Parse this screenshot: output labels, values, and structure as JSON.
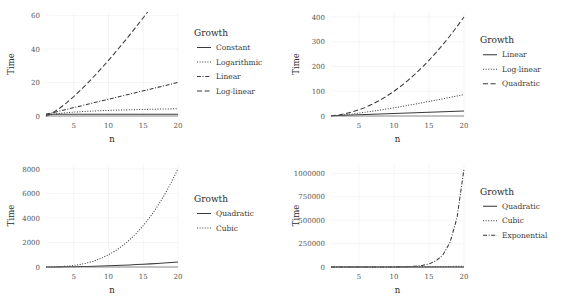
{
  "figure": {
    "background": "#ffffff",
    "line_color": "#3a3a3a",
    "grid_color": "#f2f2f2",
    "axis_color": "#6e6e6e",
    "panel_count": 4
  },
  "chart_data": [
    {
      "type": "line",
      "panel": "top-left",
      "title": "",
      "xlabel": "n",
      "ylabel": "Time",
      "legend_title": "Growth",
      "legend_position": "right",
      "grid": true,
      "xlim": [
        1,
        20
      ],
      "ylim": [
        0,
        62
      ],
      "xticks": [
        5,
        10,
        15,
        20
      ],
      "xtick_labels": [
        "5",
        "10",
        "15",
        "20"
      ],
      "yticks": [
        0,
        20,
        40,
        60
      ],
      "ytick_labels": [
        "0",
        "20",
        "40",
        "60"
      ],
      "x": [
        1,
        2,
        3,
        4,
        5,
        6,
        7,
        8,
        9,
        10,
        11,
        12,
        13,
        14,
        15,
        16,
        17,
        18,
        19,
        20
      ],
      "series": [
        {
          "name": "Constant",
          "dash": "solid",
          "values": [
            1,
            1,
            1,
            1,
            1,
            1,
            1,
            1,
            1,
            1,
            1,
            1,
            1,
            1,
            1,
            1,
            1,
            1,
            1,
            1
          ]
        },
        {
          "name": "Logarithmic",
          "dash": "dotted",
          "values": [
            0,
            1,
            1.58,
            2,
            2.32,
            2.58,
            2.81,
            3,
            3.17,
            3.32,
            3.46,
            3.58,
            3.7,
            3.81,
            3.91,
            4,
            4.09,
            4.17,
            4.25,
            4.32
          ]
        },
        {
          "name": "Linear",
          "dash": "dashdot",
          "values": [
            1,
            2,
            3,
            4,
            5,
            6,
            7,
            8,
            9,
            10,
            11,
            12,
            13,
            14,
            15,
            16,
            17,
            18,
            19,
            20
          ]
        },
        {
          "name": "Log-linear",
          "dash": "dashed",
          "values": [
            0,
            2,
            4.75,
            8,
            11.61,
            15.51,
            19.65,
            24,
            28.53,
            33.22,
            38.05,
            43,
            48.07,
            53.3,
            58.6,
            64,
            69.5,
            75.1,
            80.7,
            86.4
          ]
        }
      ]
    },
    {
      "type": "line",
      "panel": "top-right",
      "title": "",
      "xlabel": "n",
      "ylabel": "Time",
      "legend_title": "Growth",
      "legend_position": "right",
      "grid": true,
      "xlim": [
        1,
        20
      ],
      "ylim": [
        0,
        420
      ],
      "xticks": [
        5,
        10,
        15,
        20
      ],
      "xtick_labels": [
        "5",
        "10",
        "15",
        "20"
      ],
      "yticks": [
        0,
        100,
        200,
        300,
        400
      ],
      "ytick_labels": [
        "0",
        "100",
        "200",
        "300",
        "400"
      ],
      "x": [
        1,
        2,
        3,
        4,
        5,
        6,
        7,
        8,
        9,
        10,
        11,
        12,
        13,
        14,
        15,
        16,
        17,
        18,
        19,
        20
      ],
      "series": [
        {
          "name": "Linear",
          "dash": "solid",
          "values": [
            1,
            2,
            3,
            4,
            5,
            6,
            7,
            8,
            9,
            10,
            11,
            12,
            13,
            14,
            15,
            16,
            17,
            18,
            19,
            20
          ]
        },
        {
          "name": "Log-linear",
          "dash": "dotted",
          "values": [
            0,
            2,
            4.75,
            8,
            11.61,
            15.51,
            19.65,
            24,
            28.53,
            33.22,
            38.05,
            43,
            48.07,
            53.3,
            58.6,
            64,
            69.5,
            75.1,
            80.7,
            86.4
          ]
        },
        {
          "name": "Quadratic",
          "dash": "dashed",
          "values": [
            1,
            4,
            9,
            16,
            25,
            36,
            49,
            64,
            81,
            100,
            121,
            144,
            169,
            196,
            225,
            256,
            289,
            324,
            361,
            400
          ]
        }
      ]
    },
    {
      "type": "line",
      "panel": "bottom-left",
      "title": "",
      "xlabel": "n",
      "ylabel": "Time",
      "legend_title": "Growth",
      "legend_position": "right",
      "grid": true,
      "xlim": [
        1,
        20
      ],
      "ylim": [
        0,
        8400
      ],
      "xticks": [
        5,
        10,
        15,
        20
      ],
      "xtick_labels": [
        "5",
        "10",
        "15",
        "20"
      ],
      "yticks": [
        0,
        2000,
        4000,
        6000,
        8000
      ],
      "ytick_labels": [
        "0",
        "2000",
        "4000",
        "6000",
        "8000"
      ],
      "x": [
        1,
        2,
        3,
        4,
        5,
        6,
        7,
        8,
        9,
        10,
        11,
        12,
        13,
        14,
        15,
        16,
        17,
        18,
        19,
        20
      ],
      "series": [
        {
          "name": "Quadratic",
          "dash": "solid",
          "values": [
            1,
            4,
            9,
            16,
            25,
            36,
            49,
            64,
            81,
            100,
            121,
            144,
            169,
            196,
            225,
            256,
            289,
            324,
            361,
            400
          ]
        },
        {
          "name": "Cubic",
          "dash": "dotted",
          "values": [
            1,
            8,
            27,
            64,
            125,
            216,
            343,
            512,
            729,
            1000,
            1331,
            1728,
            2197,
            2744,
            3375,
            4096,
            4913,
            5832,
            6859,
            8000
          ]
        }
      ]
    },
    {
      "type": "line",
      "panel": "bottom-right",
      "title": "",
      "xlabel": "n",
      "ylabel": "Time",
      "legend_title": "Growth",
      "legend_position": "right",
      "grid": true,
      "xlim": [
        1,
        20
      ],
      "ylim": [
        0,
        1100000
      ],
      "xticks": [
        5,
        10,
        15,
        20
      ],
      "xtick_labels": [
        "5",
        "10",
        "15",
        "20"
      ],
      "yticks": [
        0,
        250000,
        500000,
        750000,
        1000000
      ],
      "ytick_labels": [
        "0",
        "250000",
        "500000",
        "750000",
        "1000000"
      ],
      "x": [
        1,
        2,
        3,
        4,
        5,
        6,
        7,
        8,
        9,
        10,
        11,
        12,
        13,
        14,
        15,
        16,
        17,
        18,
        19,
        20
      ],
      "series": [
        {
          "name": "Quadratic",
          "dash": "solid",
          "values": [
            1,
            4,
            9,
            16,
            25,
            36,
            49,
            64,
            81,
            100,
            121,
            144,
            169,
            196,
            225,
            256,
            289,
            324,
            361,
            400
          ]
        },
        {
          "name": "Cubic",
          "dash": "dotted",
          "values": [
            1,
            8,
            27,
            64,
            125,
            216,
            343,
            512,
            729,
            1000,
            1331,
            1728,
            2197,
            2744,
            3375,
            4096,
            4913,
            5832,
            6859,
            8000
          ]
        },
        {
          "name": "Exponential",
          "dash": "dashdot",
          "values": [
            2,
            4,
            8,
            16,
            32,
            64,
            128,
            256,
            512,
            1024,
            2048,
            4096,
            8192,
            16384,
            32768,
            65536,
            131072,
            262144,
            524288,
            1048576
          ]
        }
      ]
    }
  ]
}
